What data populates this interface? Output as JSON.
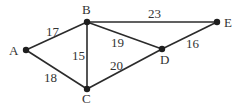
{
  "graph": {
    "nodes": [
      {
        "id": "A",
        "x": 26,
        "y": 50,
        "lx": 14,
        "ly": 55
      },
      {
        "id": "B",
        "x": 87,
        "y": 22,
        "lx": 86,
        "ly": 14
      },
      {
        "id": "C",
        "x": 87,
        "y": 89,
        "lx": 86,
        "ly": 103
      },
      {
        "id": "D",
        "x": 162,
        "y": 49,
        "lx": 165,
        "ly": 64
      },
      {
        "id": "E",
        "x": 217,
        "y": 22,
        "lx": 228,
        "ly": 27
      }
    ],
    "edges": [
      {
        "from": "A",
        "to": "B",
        "weight": "17",
        "lx": 56,
        "ly": 33
      },
      {
        "from": "A",
        "to": "C",
        "weight": "18",
        "lx": 51,
        "ly": 81
      },
      {
        "from": "B",
        "to": "C",
        "weight": "15",
        "lx": 79,
        "ly": 57
      },
      {
        "from": "B",
        "to": "E",
        "weight": "23",
        "lx": 155,
        "ly": 18
      },
      {
        "from": "B",
        "to": "D",
        "weight": "19",
        "lx": 120,
        "ly": 45
      },
      {
        "from": "C",
        "to": "D",
        "weight": "20",
        "lx": 118,
        "ly": 68
      },
      {
        "from": "D",
        "to": "E",
        "weight": "16",
        "lx": 193,
        "ly": 47
      }
    ]
  }
}
